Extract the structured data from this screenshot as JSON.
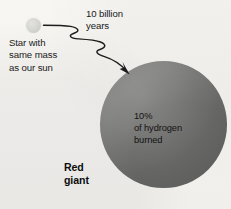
{
  "diagram": {
    "background_color": "#f5f4f1",
    "star": {
      "name": "star-with-same-mass-as-our-sun",
      "caption": "Star with\nsame mass\nas our sun",
      "color": "#d6d6d3",
      "diameter_px": 15,
      "center": {
        "x": 33,
        "y": 25
      }
    },
    "transition": {
      "name": "elapsed-time-arrow",
      "label": "10 billion\nyears",
      "style": "wavy-arrow",
      "direction": "down-right",
      "color": "#1c1c1c",
      "from": {
        "x": 44,
        "y": 25
      },
      "to": {
        "x": 128,
        "y": 73
      }
    },
    "red_giant": {
      "name": "red-giant-sphere",
      "label": "Red\ngiant",
      "inner_label": "10%\nof hydrogen\nburned",
      "color": "#757573",
      "diameter_px": 127,
      "center": {
        "x": 163,
        "y": 124
      }
    }
  }
}
